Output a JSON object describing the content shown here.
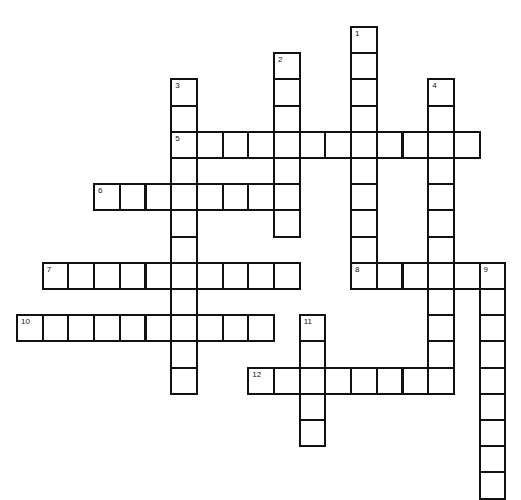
{
  "puzzle": {
    "type": "crossword",
    "grid": {
      "origin_x": 16,
      "origin_y": 26,
      "cell_w": 25.7,
      "cell_h": 26.2,
      "border_color": "#111111",
      "fill_color": "#ffffff"
    },
    "entries": [
      {
        "number": "1",
        "direction": "down",
        "row": 0,
        "col": 13,
        "length": 9
      },
      {
        "number": "2",
        "direction": "down",
        "row": 1,
        "col": 10,
        "length": 7
      },
      {
        "number": "3",
        "direction": "down",
        "row": 2,
        "col": 6,
        "length": 12
      },
      {
        "number": "4",
        "direction": "down",
        "row": 2,
        "col": 16,
        "length": 12
      },
      {
        "number": "5",
        "direction": "across",
        "row": 4,
        "col": 6,
        "length": 12
      },
      {
        "number": "6",
        "direction": "across",
        "row": 6,
        "col": 3,
        "length": 8
      },
      {
        "number": "7",
        "direction": "across",
        "row": 9,
        "col": 1,
        "length": 10
      },
      {
        "number": "8",
        "direction": "across",
        "row": 9,
        "col": 13,
        "length": 6
      },
      {
        "number": "9",
        "direction": "down",
        "row": 9,
        "col": 18,
        "length": 9
      },
      {
        "number": "10",
        "direction": "across",
        "row": 11,
        "col": 0,
        "length": 10
      },
      {
        "number": "11",
        "direction": "down",
        "row": 11,
        "col": 11,
        "length": 5
      },
      {
        "number": "12",
        "direction": "across",
        "row": 13,
        "col": 9,
        "length": 8
      }
    ]
  }
}
